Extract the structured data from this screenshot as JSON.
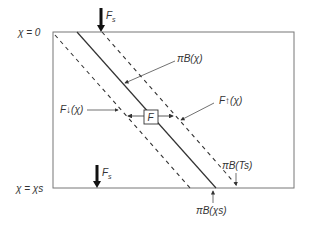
{
  "diagram": {
    "boundary_labels": {
      "top": "χ = 0",
      "bottom": "χ = χs"
    },
    "incident_flux_top": {
      "label": "F",
      "sub": "s"
    },
    "incident_flux_bottom": {
      "label": "F",
      "sub": "s"
    },
    "labels": {
      "pi_b_chi": "πB(χ)",
      "f_down": "F↓(χ)",
      "f_up": "F↑(χ)",
      "f_box": "F",
      "pi_b_ts": "πB(Ts)",
      "pi_b_chis": "πB(χs)"
    },
    "colors": {
      "line": "#333333",
      "frame": "#777777",
      "background": "#ffffff"
    }
  }
}
